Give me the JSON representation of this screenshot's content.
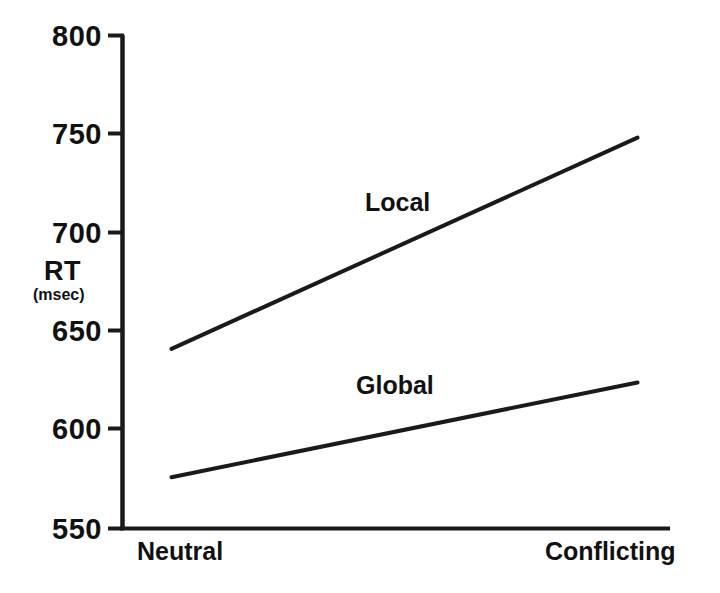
{
  "chart_data": {
    "type": "line",
    "title": "",
    "subtitle": "",
    "xlabel": "",
    "ylabel": "RT",
    "ylabel_unit": "(msec)",
    "categories": [
      "Neutral",
      "Conflicting"
    ],
    "x": [
      0,
      1
    ],
    "ylim": [
      550,
      800
    ],
    "xlim": [
      -0.27,
      1.08
    ],
    "yticks": [
      "800",
      "750",
      "700",
      "650",
      "600",
      "550"
    ],
    "ytick_values": [
      800,
      750,
      700,
      650,
      600,
      550
    ],
    "grid": false,
    "legend_position": "inline-annotation",
    "line_color": "#1a1a1a",
    "background_color": "#ffffff",
    "series": [
      {
        "name": "Local",
        "values": [
          641,
          748
        ],
        "label_x": 0.415,
        "label_y": 713
      },
      {
        "name": "Global",
        "values": [
          576,
          624
        ],
        "label_x": 0.395,
        "label_y": 619
      }
    ],
    "annotations": [
      {
        "text": "Local",
        "series": "Local"
      },
      {
        "text": "Global",
        "series": "Global"
      }
    ]
  },
  "axis": {
    "y_title": "RT",
    "y_unit": "(msec)",
    "tick_800": "800",
    "tick_750": "750",
    "tick_700": "700",
    "tick_650": "650",
    "tick_600": "600",
    "tick_550": "550",
    "x_left": "Neutral",
    "x_right": "Conflicting"
  },
  "series_labels": {
    "local": "Local",
    "global": "Global"
  }
}
